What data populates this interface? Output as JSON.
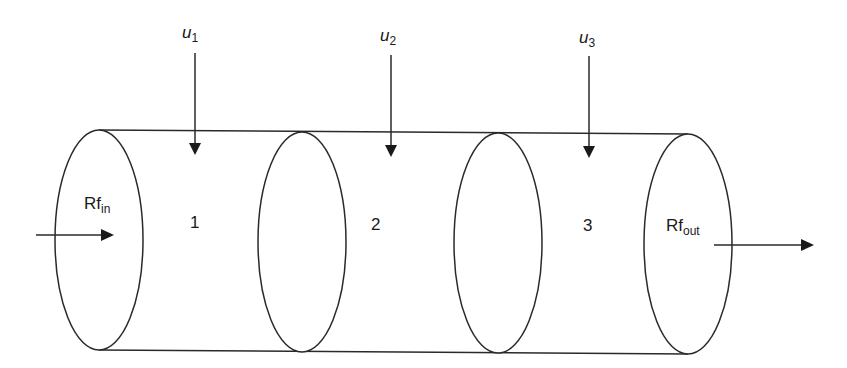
{
  "diagram": {
    "type": "tubular-reactor-segments",
    "compartments": [
      {
        "id": 1,
        "label": "1"
      },
      {
        "id": 2,
        "label": "2"
      },
      {
        "id": 3,
        "label": "3"
      }
    ],
    "inputs": [
      {
        "symbol": "u",
        "subscript": "1"
      },
      {
        "symbol": "u",
        "subscript": "2"
      },
      {
        "symbol": "u",
        "subscript": "3"
      }
    ],
    "inlet": {
      "base": "Rf",
      "subscript": "in"
    },
    "outlet": {
      "base": "Rf",
      "subscript": "out"
    },
    "colors": {
      "stroke": "#2a2a2a",
      "background": "#ffffff",
      "text": "#1a1a1a"
    }
  }
}
